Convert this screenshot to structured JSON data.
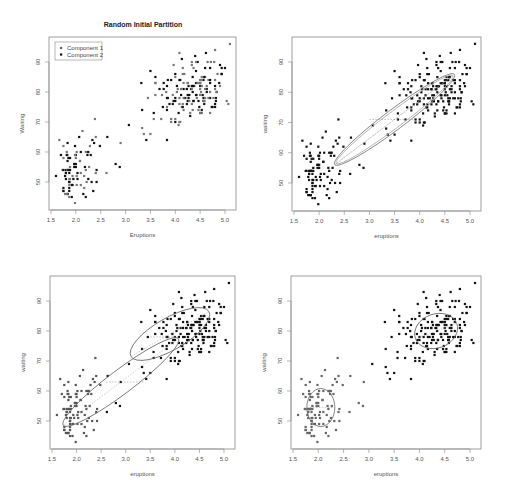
{
  "figure": {
    "title": "Random Initial Partition",
    "legend": [
      {
        "label": "Component 1",
        "color": "#666666"
      },
      {
        "label": "Component 2",
        "color": "#111111"
      }
    ]
  },
  "panels": [
    {
      "id": "p1",
      "box": [
        49,
        37,
        236,
        210
      ],
      "xlabel": "Eruptions",
      "ylabel": "Waiting",
      "legend": true,
      "ellipses": []
    },
    {
      "id": "p2",
      "box": [
        292,
        37,
        481,
        211
      ],
      "xlabel": "eruptions",
      "ylabel": "waiting",
      "legend": false,
      "ellipses": [
        {
          "cx": 3.5,
          "cy": 71,
          "rx_px": 75,
          "ry_px": 10,
          "angle": -37,
          "stroke": "#777"
        },
        {
          "cx": 3.5,
          "cy": 71,
          "rx_px": 73,
          "ry_px": 8,
          "angle": -37,
          "stroke": "#aaa"
        }
      ],
      "dashes": [
        [
          3.0,
          71,
          3.9,
          71
        ]
      ]
    },
    {
      "id": "p3",
      "box": [
        50,
        276,
        235,
        449
      ],
      "xlabel": "eruptions",
      "ylabel": "waiting",
      "legend": false,
      "ellipses": [
        {
          "cx": 3.9,
          "cy": 79,
          "rx_px": 45,
          "ry_px": 16,
          "angle": -30,
          "stroke": "#666"
        },
        {
          "cx": 2.9,
          "cy": 63,
          "rx_px": 72,
          "ry_px": 12,
          "angle": -37,
          "stroke": "#666"
        }
      ],
      "dashes": [
        [
          3.5,
          78,
          4.1,
          78
        ],
        [
          2.6,
          63,
          3.4,
          63
        ]
      ]
    },
    {
      "id": "p4",
      "box": [
        291,
        276,
        481,
        449
      ],
      "xlabel": "eruptions",
      "ylabel": "waiting",
      "legend": false,
      "ellipses": [
        {
          "cx": 4.33,
          "cy": 80,
          "rx_px": 22,
          "ry_px": 17,
          "angle": -20,
          "stroke": "#666"
        },
        {
          "cx": 2.05,
          "cy": 54.5,
          "rx_px": 14,
          "ry_px": 19,
          "angle": 0,
          "stroke": "#666"
        }
      ],
      "dashes": []
    }
  ],
  "chart_data": {
    "type": "scatter",
    "title": "Random Initial Partition",
    "xlabel": "Eruptions",
    "ylabel": "Waiting",
    "xlim": [
      1.5,
      5.2
    ],
    "ylim": [
      43,
      97
    ],
    "xticks": [
      1.5,
      2.0,
      2.5,
      3.0,
      3.5,
      4.0,
      4.5,
      5.0
    ],
    "yticks": [
      50,
      60,
      70,
      80,
      90
    ],
    "legend": [
      "Component 1",
      "Component 2"
    ],
    "layout": "2x2 grid of scatter panels (EM iterations for 2-component Gaussian mixture on Old Faithful data)",
    "panel_titles": [
      "Random Initial Partition",
      "",
      "",
      ""
    ],
    "series": [
      {
        "name": "points",
        "x": [
          3.6,
          1.8,
          3.333,
          2.283,
          4.533,
          2.883,
          4.7,
          3.6,
          1.95,
          4.35,
          1.833,
          3.917,
          4.2,
          1.75,
          4.7,
          2.167,
          1.75,
          4.8,
          1.6,
          4.25,
          1.8,
          1.75,
          3.45,
          3.067,
          4.533,
          3.6,
          1.967,
          4.083,
          3.85,
          4.433,
          4.3,
          4.467,
          3.367,
          4.033,
          3.833,
          2.017,
          1.867,
          4.833,
          1.833,
          4.783,
          4.35,
          1.883,
          4.567,
          1.75,
          4.533,
          3.317,
          3.833,
          2.1,
          4.633,
          2,
          4.8,
          4.716,
          1.833,
          4.833,
          1.733,
          4.883,
          3.717,
          1.667,
          4.567,
          4.317,
          2.233,
          4.5,
          1.75,
          4.8,
          1.817,
          4.4,
          4.167,
          4.7,
          2.067,
          4.7,
          4.033,
          1.967,
          4.5,
          4,
          1.983,
          5.067,
          2.017,
          4.567,
          3.883,
          3.6,
          4.133,
          4.333,
          4.1,
          2.633,
          4.067,
          4.933,
          3.95,
          4.517,
          2.167,
          4,
          2.2,
          4.333,
          1.867,
          4.817,
          1.833,
          4.3,
          4.667,
          3.75,
          1.867,
          4.9,
          2.483,
          4.367,
          2.1,
          4.5,
          4.05,
          1.867,
          4.7,
          1.783,
          4.85,
          3.683,
          4.733,
          2.3,
          4.9,
          4.417,
          1.7,
          4.633,
          2.317,
          4.6,
          1.817,
          4.417,
          2.617,
          4.067,
          4.25,
          1.967,
          4.6,
          3.767,
          1.917,
          4.5,
          2.267,
          4.65,
          1.867,
          4.167,
          2.8,
          4.333,
          1.833,
          4.383,
          1.883,
          4.933,
          2.033,
          3.733,
          4.233,
          2.233,
          4.533,
          4.817,
          4.333,
          1.983,
          4.633,
          2.017,
          5.1,
          1.8,
          5.033,
          4,
          2.4,
          4.6,
          3.567,
          4,
          4.5,
          4.083,
          1.8,
          3.967,
          2.2,
          4.15,
          2,
          3.833,
          3.5,
          4.583,
          2.367,
          5,
          1.933,
          4.617,
          1.917,
          2.083,
          4.583,
          3.333,
          4.167,
          4.333,
          4.5,
          2.417,
          4,
          4.167,
          1.883,
          4.583,
          4.25,
          3.767,
          2.033,
          4.433,
          4.083,
          1.833,
          4.417,
          2.183,
          4.8,
          1.833,
          4.8,
          4.1,
          3.966,
          4.233,
          3.5,
          4.366,
          2.25,
          4.667,
          2.1,
          4.35,
          4.133,
          1.867,
          4.6,
          1.783,
          4.367,
          3.85,
          1.933,
          4.5,
          2.383,
          4.7,
          1.867,
          3.833,
          3.417,
          4.233,
          2.4,
          4.8,
          2,
          4.15,
          1.867,
          4.267,
          1.75,
          4.483,
          4,
          4.117,
          4.083,
          4.267,
          3.917,
          4.55,
          4.083,
          2.417,
          4.183,
          2.217,
          4.45,
          1.883,
          1.85,
          4.283,
          3.95,
          2.333,
          4.15,
          2.35,
          4.933,
          2.9,
          4.583,
          3.833,
          2.083,
          4.367,
          2.133,
          4.35,
          2.2,
          4.45,
          3.567,
          4.5,
          4.15,
          3.817,
          3.917,
          4.45,
          2,
          4.283,
          4.767,
          4.533,
          1.85,
          4.25,
          1.983,
          2.25,
          4.75,
          4.117,
          2.15,
          4.417,
          1.817,
          4.467
        ],
        "y": [
          79,
          54,
          74,
          62,
          85,
          55,
          88,
          85,
          51,
          85,
          54,
          84,
          78,
          47,
          83,
          52,
          62,
          84,
          52,
          79,
          51,
          47,
          78,
          69,
          74,
          83,
          55,
          76,
          78,
          79,
          73,
          77,
          66,
          80,
          74,
          52,
          48,
          80,
          59,
          90,
          80,
          58,
          84,
          58,
          73,
          83,
          64,
          53,
          82,
          59,
          75,
          90,
          54,
          80,
          54,
          83,
          71,
          64,
          77,
          81,
          59,
          84,
          48,
          82,
          60,
          92,
          78,
          78,
          65,
          73,
          82,
          56,
          79,
          71,
          62,
          76,
          60,
          78,
          76,
          83,
          75,
          82,
          70,
          65,
          73,
          88,
          76,
          80,
          48,
          86,
          60,
          90,
          50,
          78,
          63,
          72,
          84,
          75,
          51,
          82,
          62,
          88,
          49,
          83,
          81,
          47,
          84,
          52,
          86,
          81,
          75,
          59,
          89,
          79,
          59,
          81,
          50,
          85,
          59,
          87,
          53,
          69,
          77,
          56,
          88,
          81,
          45,
          82,
          55,
          90,
          45,
          83,
          56,
          89,
          46,
          82,
          51,
          86,
          53,
          79,
          81,
          60,
          82,
          77,
          76,
          59,
          80,
          49,
          96,
          53,
          77,
          77,
          65,
          81,
          71,
          70,
          81,
          93,
          53,
          89,
          45,
          86,
          58,
          78,
          66,
          76,
          63,
          88,
          52,
          93,
          49,
          57,
          77,
          68,
          81,
          81,
          73,
          50,
          85,
          74,
          55,
          77,
          83,
          83,
          51,
          78,
          84,
          46,
          83,
          55,
          81,
          57,
          76,
          84,
          77,
          81,
          87,
          77,
          51,
          78,
          60,
          82,
          91,
          53,
          78,
          46,
          77,
          84,
          49,
          83,
          71,
          80,
          49,
          75,
          64,
          76,
          53,
          94,
          55,
          76,
          50,
          82,
          54,
          75,
          78,
          79,
          78,
          78,
          70,
          79,
          70,
          54,
          86,
          50,
          90,
          54,
          54,
          77,
          79,
          64,
          75,
          47,
          86,
          63,
          85,
          82,
          57,
          82,
          67,
          74,
          54,
          83,
          73,
          73,
          88,
          80,
          71,
          83,
          56,
          79,
          78,
          84,
          58,
          83,
          43,
          60,
          75,
          81,
          46,
          90,
          46,
          74
        ]
      }
    ]
  }
}
